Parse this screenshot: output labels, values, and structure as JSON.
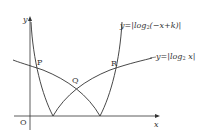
{
  "figure": {
    "axes": {
      "x_label": "x",
      "y_label": "y",
      "origin_label": "O"
    },
    "curves": [
      {
        "name": "y=|log2(-x+k)|",
        "prefix": "y=|log",
        "base": "2",
        "arg": "(−x+k)|"
      },
      {
        "name": "y=|log2 x|",
        "prefix": "y=|log",
        "base": "2",
        "arg": " x|"
      }
    ],
    "points": [
      "P",
      "Q",
      "R"
    ],
    "colors": {
      "line": "#333333",
      "background": "#ffffff"
    }
  }
}
